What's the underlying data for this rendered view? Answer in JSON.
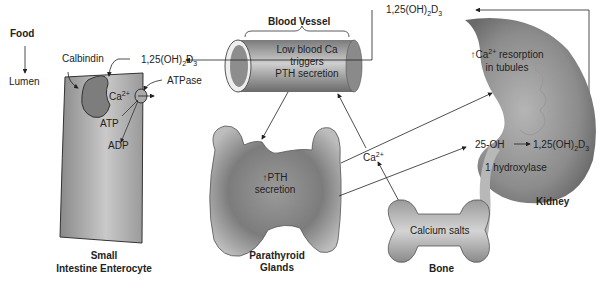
{
  "food": {
    "label": "Food",
    "lumen": "Lumen"
  },
  "enterocyte": {
    "title_line1": "Small",
    "title_line2": "Intestine Enterocyte",
    "calbindin": "Calbindin",
    "ca": "Ca",
    "ca_sup": "2+",
    "atpase": "ATPase",
    "atp": "ATP",
    "adp": "ADP",
    "vitd_prefix": "1,25(OH)",
    "vitd_sub2": "2",
    "vitd_D": "D",
    "vitd_sub3": "3"
  },
  "blood_vessel": {
    "title": "Blood Vessel",
    "line1": "Low blood Ca",
    "line2": "triggers",
    "line3": "PTH secretion"
  },
  "parathyroid": {
    "arrow": "↑",
    "line1": "PTH",
    "line2": "secretion",
    "title_line1": "Parathyroid",
    "title_line2": "Glands"
  },
  "calcium_ion": {
    "ca": "Ca",
    "sup": "2+"
  },
  "bone": {
    "inner": "Calcium salts",
    "title": "Bone"
  },
  "kidney": {
    "title": "Kidney",
    "resorption_arrow": "↑",
    "resorption_ca": "Ca",
    "resorption_sup": "2+",
    "resorption_rest": " resorption",
    "resorption_line2": "in tubules",
    "oh25": "25-OH",
    "hydroxylase": "1 hydroxylase",
    "vitd_prefix": "1,25(OH)",
    "vitd_sub2": "2",
    "vitd_D": "D",
    "vitd_sub3": "3"
  },
  "top_vitd": {
    "prefix": "1,25(OH)",
    "sub2": "2",
    "D": "D",
    "sub3": "3"
  },
  "colors": {
    "ink": "#222222",
    "organ_dark": "#6e6e6e",
    "organ_light": "#c8c8c8",
    "background": "#ffffff"
  }
}
